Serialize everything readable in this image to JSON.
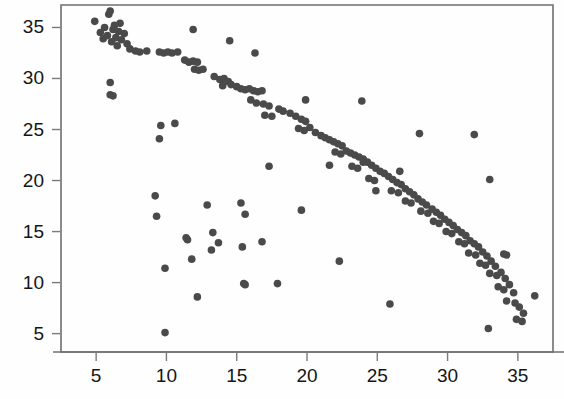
{
  "figure": {
    "background_color": "#fefefe",
    "frame_color": "#6f6f6f",
    "marker_color": "#4a4a4a",
    "label_color": "#151515"
  },
  "chart_data": {
    "type": "scatter",
    "title": "",
    "subtitle": "",
    "xlabel": "",
    "ylabel": "",
    "xlim": [
      2.5,
      37.5
    ],
    "ylim": [
      3.2,
      37.2
    ],
    "xticks": [
      5,
      10,
      15,
      20,
      25,
      30,
      35
    ],
    "yticks": [
      5,
      10,
      15,
      20,
      25,
      30,
      35
    ],
    "xticklabels": [
      "5",
      "10",
      "15",
      "20",
      "25",
      "30",
      "35"
    ],
    "yticklabels": [
      "5",
      "10",
      "15",
      "20",
      "25",
      "30",
      "35"
    ],
    "grid": false,
    "legend": null,
    "annotations": [],
    "marker": {
      "shape": "circle",
      "color": "#4a4a4a",
      "size_px": 7.6
    },
    "series": [
      {
        "name": "main-trend",
        "description": "dense negatively-sloped band from upper-left to lower-right",
        "points": [
          [
            4.9,
            35.6
          ],
          [
            5.3,
            34.5
          ],
          [
            5.5,
            33.9
          ],
          [
            5.6,
            35.0
          ],
          [
            5.8,
            34.2
          ],
          [
            5.9,
            36.3
          ],
          [
            6.0,
            36.6
          ],
          [
            6.1,
            33.6
          ],
          [
            6.2,
            34.8
          ],
          [
            6.3,
            35.2
          ],
          [
            6.4,
            34.0
          ],
          [
            6.5,
            33.2
          ],
          [
            6.6,
            34.6
          ],
          [
            6.7,
            35.4
          ],
          [
            6.8,
            33.8
          ],
          [
            7.0,
            34.4
          ],
          [
            7.2,
            33.4
          ],
          [
            7.4,
            32.9
          ],
          [
            7.8,
            32.7
          ],
          [
            8.1,
            32.6
          ],
          [
            8.6,
            32.7
          ],
          [
            9.5,
            32.6
          ],
          [
            9.8,
            32.5
          ],
          [
            10.1,
            32.6
          ],
          [
            10.4,
            32.5
          ],
          [
            10.8,
            32.6
          ],
          [
            11.3,
            31.8
          ],
          [
            11.6,
            31.6
          ],
          [
            11.9,
            31.7
          ],
          [
            12.2,
            31.6
          ],
          [
            12.0,
            30.9
          ],
          [
            12.3,
            30.8
          ],
          [
            12.6,
            30.9
          ],
          [
            13.4,
            30.2
          ],
          [
            13.8,
            29.9
          ],
          [
            14.1,
            30.0
          ],
          [
            14.4,
            29.7
          ],
          [
            14.0,
            29.3
          ],
          [
            14.6,
            29.4
          ],
          [
            15.0,
            29.2
          ],
          [
            15.3,
            29.0
          ],
          [
            15.6,
            28.9
          ],
          [
            15.9,
            29.0
          ],
          [
            16.2,
            28.8
          ],
          [
            16.5,
            28.7
          ],
          [
            16.8,
            28.8
          ],
          [
            16.0,
            27.9
          ],
          [
            16.4,
            27.6
          ],
          [
            16.9,
            27.5
          ],
          [
            17.3,
            27.3
          ],
          [
            17.0,
            26.4
          ],
          [
            17.5,
            26.3
          ],
          [
            18.0,
            27.0
          ],
          [
            18.3,
            26.8
          ],
          [
            18.8,
            26.6
          ],
          [
            19.2,
            26.3
          ],
          [
            19.6,
            26.0
          ],
          [
            19.9,
            25.8
          ],
          [
            19.4,
            25.1
          ],
          [
            19.8,
            24.9
          ],
          [
            20.2,
            25.2
          ],
          [
            20.6,
            24.7
          ],
          [
            21.0,
            24.4
          ],
          [
            21.3,
            24.2
          ],
          [
            21.6,
            24.0
          ],
          [
            21.9,
            23.8
          ],
          [
            22.2,
            23.6
          ],
          [
            22.5,
            23.4
          ],
          [
            22.0,
            22.8
          ],
          [
            22.4,
            22.6
          ],
          [
            22.8,
            22.9
          ],
          [
            23.1,
            22.7
          ],
          [
            23.4,
            22.5
          ],
          [
            23.7,
            22.3
          ],
          [
            24.0,
            22.1
          ],
          [
            23.2,
            21.4
          ],
          [
            23.6,
            21.2
          ],
          [
            24.3,
            21.8
          ],
          [
            24.6,
            21.5
          ],
          [
            24.9,
            21.2
          ],
          [
            25.2,
            20.9
          ],
          [
            25.5,
            20.7
          ],
          [
            24.4,
            20.2
          ],
          [
            24.8,
            20.0
          ],
          [
            25.8,
            20.4
          ],
          [
            26.1,
            20.1
          ],
          [
            26.4,
            19.8
          ],
          [
            26.7,
            19.6
          ],
          [
            26.0,
            19.0
          ],
          [
            26.5,
            18.8
          ],
          [
            27.0,
            19.2
          ],
          [
            27.3,
            18.9
          ],
          [
            27.6,
            18.6
          ],
          [
            27.0,
            18.0
          ],
          [
            27.4,
            17.8
          ],
          [
            27.9,
            18.2
          ],
          [
            28.2,
            17.9
          ],
          [
            28.5,
            17.6
          ],
          [
            28.1,
            17.0
          ],
          [
            28.6,
            16.8
          ],
          [
            28.9,
            17.2
          ],
          [
            29.2,
            16.9
          ],
          [
            29.5,
            16.6
          ],
          [
            29.0,
            16.0
          ],
          [
            29.4,
            15.8
          ],
          [
            29.8,
            16.2
          ],
          [
            30.1,
            15.9
          ],
          [
            30.4,
            15.6
          ],
          [
            29.9,
            15.0
          ],
          [
            30.3,
            14.8
          ],
          [
            30.7,
            15.2
          ],
          [
            31.0,
            14.9
          ],
          [
            31.3,
            14.6
          ],
          [
            30.8,
            14.0
          ],
          [
            31.2,
            13.8
          ],
          [
            31.6,
            14.1
          ],
          [
            31.9,
            13.8
          ],
          [
            32.2,
            13.5
          ],
          [
            31.5,
            12.9
          ],
          [
            32.0,
            12.7
          ],
          [
            32.5,
            13.0
          ],
          [
            32.8,
            12.6
          ],
          [
            32.3,
            11.9
          ],
          [
            32.7,
            11.7
          ],
          [
            33.1,
            12.1
          ],
          [
            33.4,
            11.6
          ],
          [
            33.0,
            10.9
          ],
          [
            33.5,
            10.7
          ],
          [
            33.8,
            11.0
          ],
          [
            34.1,
            10.4
          ],
          [
            33.6,
            9.6
          ],
          [
            34.0,
            9.3
          ],
          [
            34.4,
            9.8
          ],
          [
            34.7,
            9.0
          ],
          [
            34.2,
            8.2
          ],
          [
            34.8,
            8.0
          ],
          [
            35.1,
            7.6
          ],
          [
            35.4,
            7.0
          ],
          [
            34.9,
            6.4
          ],
          [
            35.3,
            6.2
          ],
          [
            32.9,
            5.5
          ],
          [
            36.2,
            8.7
          ]
        ]
      },
      {
        "name": "lower-scatter",
        "description": "diffuse cloud of outlier points lying well below the main band",
        "points": [
          [
            6.0,
            29.6
          ],
          [
            6.0,
            28.4
          ],
          [
            6.2,
            28.3
          ],
          [
            9.6,
            25.4
          ],
          [
            9.5,
            24.1
          ],
          [
            10.6,
            25.6
          ],
          [
            11.9,
            34.8
          ],
          [
            14.5,
            33.7
          ],
          [
            16.3,
            32.5
          ],
          [
            9.2,
            18.5
          ],
          [
            9.3,
            16.5
          ],
          [
            9.9,
            11.4
          ],
          [
            9.9,
            5.1
          ],
          [
            11.4,
            14.4
          ],
          [
            11.5,
            14.2
          ],
          [
            11.8,
            12.3
          ],
          [
            12.2,
            8.6
          ],
          [
            12.9,
            17.6
          ],
          [
            13.2,
            13.2
          ],
          [
            13.3,
            14.9
          ],
          [
            13.7,
            13.9
          ],
          [
            15.3,
            17.8
          ],
          [
            15.6,
            16.7
          ],
          [
            15.4,
            13.5
          ],
          [
            15.5,
            9.9
          ],
          [
            15.6,
            9.8
          ],
          [
            16.8,
            14.0
          ],
          [
            17.3,
            21.4
          ],
          [
            17.9,
            9.9
          ],
          [
            19.6,
            17.1
          ],
          [
            19.9,
            27.9
          ],
          [
            21.6,
            21.5
          ],
          [
            22.3,
            12.1
          ],
          [
            23.9,
            27.8
          ],
          [
            24.0,
            21.8
          ],
          [
            24.9,
            19.0
          ],
          [
            25.9,
            7.9
          ],
          [
            26.6,
            20.9
          ],
          [
            28.0,
            24.6
          ],
          [
            31.9,
            24.5
          ],
          [
            33.0,
            20.1
          ],
          [
            34.0,
            12.8
          ],
          [
            34.2,
            12.7
          ]
        ]
      }
    ]
  }
}
